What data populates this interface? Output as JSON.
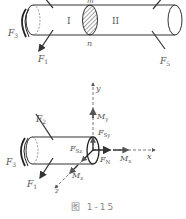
{
  "figure": {
    "caption": "图 1-15",
    "top_diagram": {
      "section_labels": {
        "top": "m",
        "bottom": "n"
      },
      "region_labels": [
        "I",
        "II"
      ],
      "forces": {
        "F1": "F",
        "F1_sub": "1",
        "F3": "F",
        "F3_sub": "3",
        "F5": "F",
        "F5_sub": "5"
      }
    },
    "bottom_diagram": {
      "axes": {
        "x": "x",
        "y": "y",
        "z": "z"
      },
      "forces": {
        "F1": "F",
        "F1_sub": "1",
        "F2": "F",
        "F2_sub": "2",
        "F3": "F",
        "F3_sub": "3",
        "FN": "F",
        "FN_sub": "N",
        "FSy": "F",
        "FSy_sub": "Sy",
        "FSz": "F",
        "FSz_sub": "Sz"
      },
      "moments": {
        "Mx": "M",
        "Mx_sub": "x",
        "My": "M",
        "My_sub": "y",
        "Mz": "M",
        "Mz_sub": "z"
      }
    },
    "colors": {
      "line": "#333333",
      "label": "#555555",
      "hatch": "#444444"
    }
  }
}
